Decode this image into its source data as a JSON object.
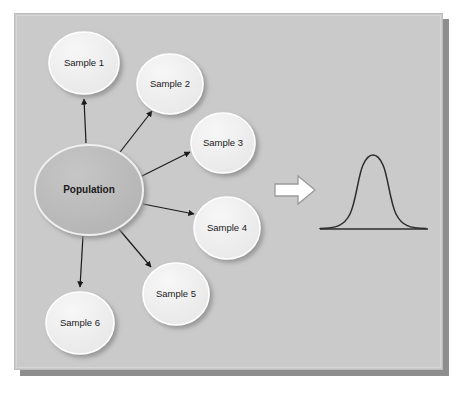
{
  "diagram": {
    "background_color": "#cacaca",
    "panel_border_color": "#bdbdbd",
    "shadow_color": "#8d8d8d",
    "population": {
      "label": "Population",
      "fill_color": "#bcbcbc",
      "stroke_color": "#efefef",
      "cx": 89,
      "cy": 190,
      "rx": 54,
      "ry": 45
    },
    "samples": [
      {
        "label": "Sample 1",
        "cx": 84,
        "cy": 63,
        "rx": 35,
        "ry": 31
      },
      {
        "label": "Sample 2",
        "cx": 170,
        "cy": 84,
        "rx": 33,
        "ry": 30
      },
      {
        "label": "Sample 3",
        "cx": 223,
        "cy": 143,
        "rx": 32,
        "ry": 30
      },
      {
        "label": "Sample 4",
        "cx": 227,
        "cy": 228,
        "rx": 33,
        "ry": 31
      },
      {
        "label": "Sample 5",
        "cx": 176,
        "cy": 294,
        "rx": 33,
        "ry": 31
      },
      {
        "label": "Sample 6",
        "cx": 80,
        "cy": 323,
        "rx": 34,
        "ry": 31
      }
    ],
    "sample_fill_color": "#f2f2f2",
    "sample_stroke_color": "#ffffff",
    "arrows": [
      {
        "name": "population-to-sample-1",
        "x1": 86,
        "y1": 143,
        "x2": 84,
        "y2": 97
      },
      {
        "name": "population-to-sample-2",
        "x1": 117,
        "y1": 156,
        "x2": 151,
        "y2": 110
      },
      {
        "name": "population-to-sample-3",
        "x1": 140,
        "y1": 177,
        "x2": 190,
        "y2": 152
      },
      {
        "name": "population-to-sample-4",
        "x1": 143,
        "y1": 204,
        "x2": 194,
        "y2": 214
      },
      {
        "name": "population-to-sample-5",
        "x1": 118,
        "y1": 228,
        "x2": 152,
        "y2": 268
      },
      {
        "name": "population-to-sample-6",
        "x1": 83,
        "y1": 236,
        "x2": 80,
        "y2": 288
      }
    ],
    "arrow_color": "#1a1a1a",
    "block_arrow": {
      "name": "transform-arrow",
      "fill_color": "#ffffff",
      "stroke_color": "#9a9a9a",
      "x": 275,
      "y": 176,
      "width": 40,
      "height": 28
    },
    "curve": {
      "name": "normal-distribution-curve",
      "stroke_color": "#2b2b2b",
      "baseline_y": 229,
      "baseline_x1": 320,
      "baseline_x2": 428,
      "peak_x": 373,
      "peak_y": 157,
      "sigma": 11.5
    }
  }
}
